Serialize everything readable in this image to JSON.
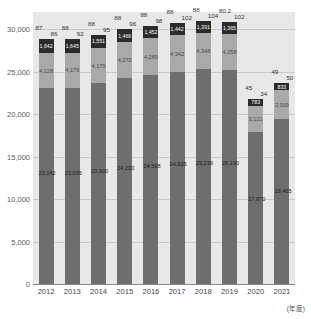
{
  "chart_data": {
    "type": "bar",
    "stacked": true,
    "title": "",
    "xlabel": "(年度)",
    "ylabel": "",
    "ylim": [
      0,
      32000
    ],
    "yticks": [
      0,
      5000,
      10000,
      15000,
      20000,
      25000,
      30000
    ],
    "ytick_labels": [
      "0",
      "5,000",
      "10,000",
      "15,000",
      "20,000",
      "25,000",
      "30,000"
    ],
    "grid": true,
    "legend": "none",
    "categories": [
      "2012",
      "2013",
      "2014",
      "2015",
      "2016",
      "2017",
      "2018",
      "2019",
      "2020",
      "2021"
    ],
    "series": [
      {
        "name": "base",
        "color": "#6e6e6e",
        "values": [
          23042,
          23035,
          23600,
          24230,
          24598,
          24925,
          25239,
          25190,
          17870,
          19465
        ],
        "labels": [
          "23,042",
          "23,035",
          "23,600",
          "24,230",
          "24,598",
          "24,925",
          "25,239",
          "25,190",
          "17,870",
          "19,465"
        ]
      },
      {
        "name": "mid",
        "color": "#a9a9a9",
        "values": [
          4128,
          4176,
          4175,
          4270,
          4289,
          4342,
          4348,
          4258,
          3121,
          3309
        ],
        "labels": [
          "4,128",
          "4,176",
          "4,175",
          "4,270",
          "4,289",
          "4,342",
          "4,348",
          "4,258",
          "3,121",
          "3,309"
        ]
      },
      {
        "name": "top",
        "color": "#2b2b2b",
        "values": [
          1642,
          1645,
          1551,
          1466,
          1452,
          1442,
          1391,
          1365,
          783,
          833
        ],
        "labels": [
          "1,642",
          "1,645",
          "1,551",
          "1,466",
          "1,452",
          "1,442",
          "1,391",
          "1,365",
          "783",
          "833"
        ]
      }
    ],
    "annotations_upper": [
      "87",
      "88",
      "88",
      "88",
      "88",
      "88",
      "88",
      "80.2",
      "45",
      "49"
    ],
    "annotations_lower": [
      "86",
      "92",
      "95",
      "96",
      "98",
      "102",
      "104",
      "102",
      "34",
      "50"
    ]
  }
}
